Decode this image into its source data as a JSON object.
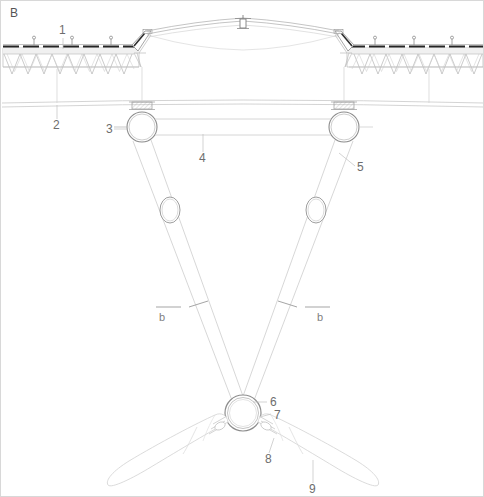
{
  "figure": {
    "panel_letter": "B",
    "background_color": "#ffffff",
    "line_color": "#c9c9c9",
    "dark_line_color": "#2b2b2b",
    "label_color": "#6d6d6d",
    "width": 484,
    "height": 497
  },
  "callouts": [
    {
      "id": "1",
      "text": "1",
      "x": 58,
      "y": 33,
      "leader": {
        "x1": 62,
        "y1": 37,
        "x2": 62,
        "y2": 48
      }
    },
    {
      "id": "2",
      "text": "2",
      "x": 52,
      "y": 128,
      "leader": {
        "x1": 56,
        "y1": 118,
        "x2": 56,
        "y2": 104
      }
    },
    {
      "id": "3",
      "text": "3",
      "x": 108,
      "y": 132,
      "leader": {
        "x1": 113,
        "y1": 128,
        "x2": 128,
        "y2": 128
      }
    },
    {
      "id": "4",
      "text": "4",
      "x": 198,
      "y": 161,
      "leader": {
        "x1": 202,
        "y1": 151,
        "x2": 202,
        "y2": 135
      }
    },
    {
      "id": "5",
      "text": "5",
      "x": 356,
      "y": 169,
      "leader": {
        "x1": 354,
        "y1": 165,
        "x2": 336,
        "y2": 152
      }
    },
    {
      "id": "6",
      "text": "6",
      "x": 268,
      "y": 405,
      "leader": {
        "x1": 266,
        "y1": 401,
        "x2": 254,
        "y2": 401
      }
    },
    {
      "id": "7",
      "text": "7",
      "x": 272,
      "y": 415,
      "leader": {
        "x1": 270,
        "y1": 411,
        "x2": 258,
        "y2": 414
      }
    },
    {
      "id": "8",
      "text": "8",
      "x": 265,
      "y": 461,
      "leader": {
        "x1": 268,
        "y1": 452,
        "x2": 272,
        "y2": 438
      }
    },
    {
      "id": "9",
      "text": "9",
      "x": 310,
      "y": 491,
      "leader": {
        "x1": 312,
        "y1": 482,
        "x2": 312,
        "y2": 460
      }
    }
  ],
  "section_marks": [
    {
      "id": "b-left",
      "text": "b",
      "x": 160,
      "y": 320
    },
    {
      "id": "b-right",
      "text": "b",
      "x": 316,
      "y": 320
    }
  ],
  "components": {
    "roof_panel_left": "corrugated-roof-panel-left",
    "roof_panel_right": "corrugated-roof-panel-right",
    "ridge_cables": "ridge-cable-pair",
    "apex_fitting": "apex-fitting",
    "horizontal_cables": "horizontal-cable-pair",
    "pulley_left": "pulley-left",
    "pulley_right": "pulley-right",
    "cross_bar": "cross-bar",
    "suspension_arm_left": "suspension-arm-left",
    "suspension_arm_right": "suspension-arm-right",
    "ring_left": "ring-left",
    "ring_right": "ring-right",
    "hub": "central-hub",
    "blade_left": "blade-left",
    "blade_right": "blade-right",
    "clamp_left": "clamp-left",
    "clamp_right": "clamp-right"
  }
}
